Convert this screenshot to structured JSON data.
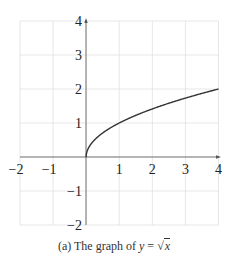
{
  "chart_data": {
    "type": "line",
    "title": "",
    "caption_prefix": "(a) The graph of ",
    "caption_var": "y",
    "caption_eq": " = ",
    "caption_sqrt_sym": "√",
    "caption_sqrt_arg": "x",
    "function": "y = sqrt(x)",
    "xlabel": "",
    "ylabel": "",
    "xlim": [
      -2,
      4
    ],
    "ylim": [
      -2,
      4
    ],
    "xticks": [
      "−2",
      "−1",
      "1",
      "2",
      "3",
      "4"
    ],
    "yticks": [
      "4",
      "3",
      "2",
      "1",
      "−1",
      "−2"
    ],
    "grid": true,
    "series": [
      {
        "name": "sqrt(x)",
        "x": [
          0,
          0.0625,
          0.25,
          0.5,
          1,
          1.5,
          2,
          2.5,
          3,
          3.5,
          4
        ],
        "y": [
          0,
          0.25,
          0.5,
          0.707,
          1,
          1.225,
          1.414,
          1.581,
          1.732,
          1.871,
          2
        ]
      }
    ],
    "colors": {
      "curve": "#333333",
      "grid": "#dddddd",
      "axis": "#555555"
    }
  }
}
